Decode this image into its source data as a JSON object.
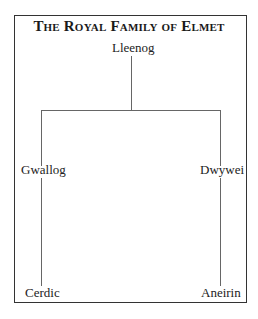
{
  "title": "The Royal Family of Elmet",
  "people": {
    "root": "Lleenog",
    "left_child": "Gwallog",
    "right_child": "Dwywei",
    "left_grandchild": "Cerdic",
    "right_grandchild": "Aneirin"
  },
  "relations": [
    {
      "parent": "Lleenog",
      "child": "Gwallog"
    },
    {
      "parent": "Lleenog",
      "child": "Dwywei"
    },
    {
      "parent": "Gwallog",
      "child": "Cerdic"
    },
    {
      "parent": "Dwywei",
      "child": "Aneirin"
    }
  ]
}
